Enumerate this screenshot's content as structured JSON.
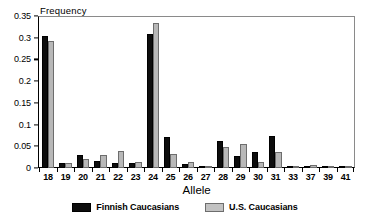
{
  "chart_data": {
    "type": "bar",
    "title": "",
    "xlabel": "Allele",
    "ylabel": "Frequency",
    "ylim": [
      0,
      0.35
    ],
    "yticks": [
      0,
      0.05,
      0.1,
      0.15,
      0.2,
      0.25,
      0.3,
      0.35
    ],
    "ytick_labels": [
      "0",
      "0.05",
      "0.1",
      "0.15",
      "0.2",
      "0.25",
      "0.3",
      "0.35"
    ],
    "grid": false,
    "legend_position": "bottom",
    "categories": [
      "18",
      "19",
      "20",
      "21",
      "22",
      "23",
      "24",
      "25",
      "26",
      "27",
      "28",
      "29",
      "30",
      "31",
      "33",
      "37",
      "39",
      "41"
    ],
    "series": [
      {
        "name": "Finnish Caucasians",
        "color": "#0d0d0d",
        "values": [
          0.305,
          0.011,
          0.03,
          0.017,
          0.012,
          0.011,
          0.308,
          0.072,
          0.009,
          0.005,
          0.063,
          0.028,
          0.038,
          0.073,
          0.0,
          0.004,
          0.0,
          0.0
        ]
      },
      {
        "name": "U.S. Caucasians",
        "color": "#b8b8b8",
        "values": [
          0.292,
          0.011,
          0.021,
          0.03,
          0.04,
          0.013,
          0.333,
          0.033,
          0.013,
          0.0,
          0.049,
          0.055,
          0.013,
          0.038,
          0.003,
          0.007,
          0.003,
          0.003
        ]
      }
    ]
  }
}
